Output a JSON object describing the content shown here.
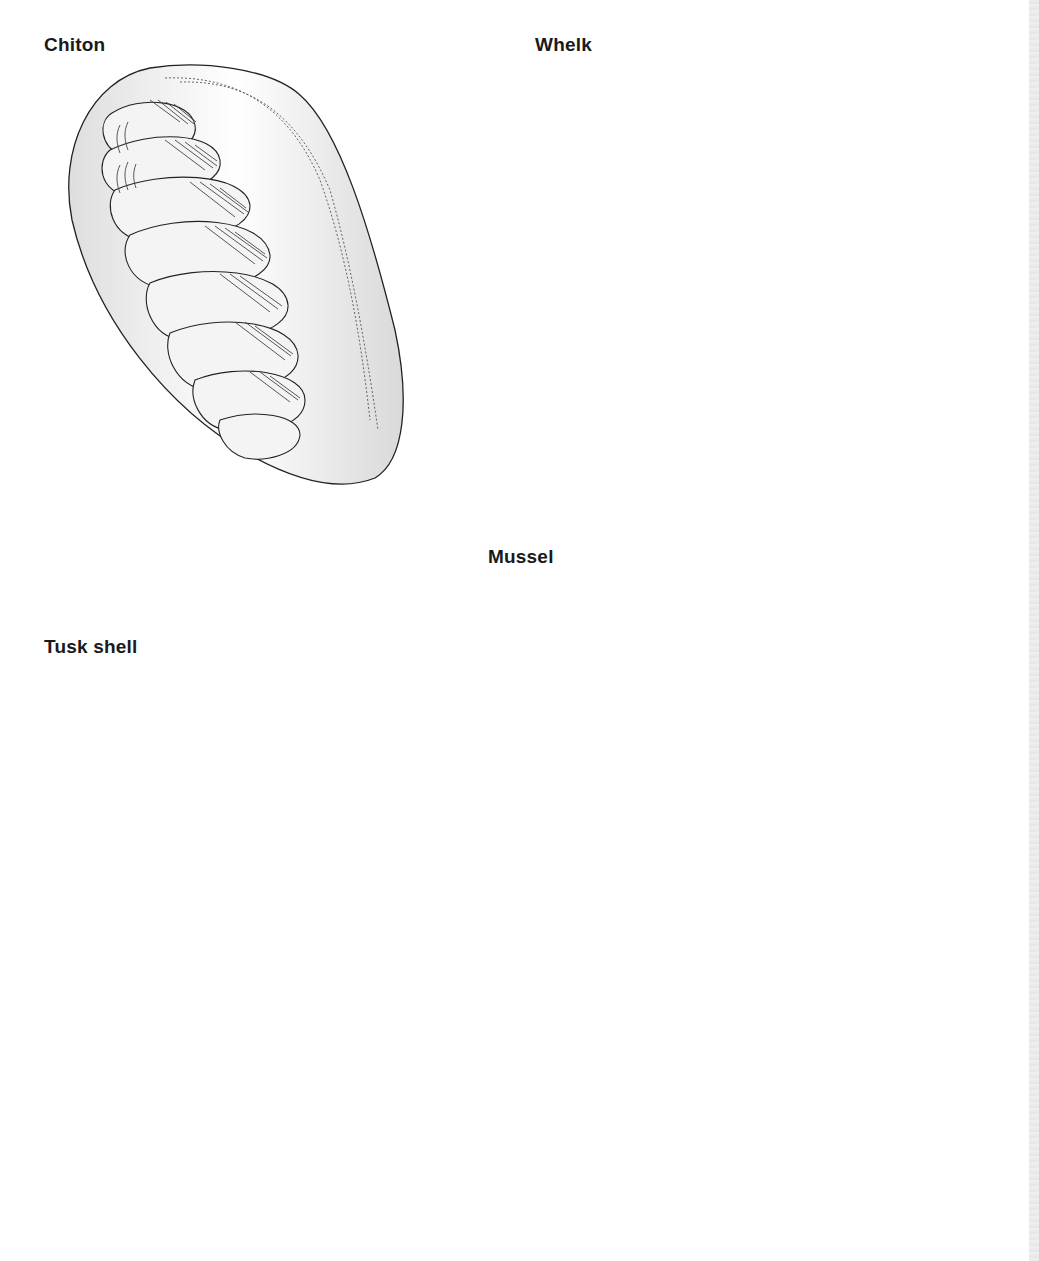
{
  "page": {
    "type": "illustrated book page",
    "background": "#ffffff",
    "edge_strip_color": "#ebebeb"
  },
  "labels": {
    "chiton": "Chiton",
    "whelk": "Whelk",
    "mussel": "Mussel",
    "tusk_shell": "Tusk shell"
  },
  "illustrations": [
    {
      "name": "chiton",
      "label": "Chiton",
      "fill": "#e6e6e6",
      "stroke": "#222222"
    },
    {
      "name": "whelk",
      "label": "Whelk",
      "fill": "#9a9a9a",
      "highlight": "#f2f2f2",
      "stroke": "#222222"
    },
    {
      "name": "mussel",
      "label": "Mussel",
      "fill": "#8f8f8f",
      "stroke": "#222222",
      "rock_fill": "#7d7d7d"
    },
    {
      "name": "tusk-shell",
      "label": "Tusk shell",
      "fill": "#cfcfcf",
      "stroke": "#222222"
    },
    {
      "name": "partial-shell-bottom",
      "label": "",
      "fill": "#d0d0d0",
      "stroke": "#222222"
    }
  ]
}
